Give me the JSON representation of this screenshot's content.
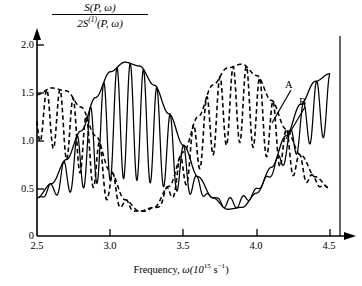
{
  "chart_data": {
    "type": "line",
    "title": "",
    "xlabel": "Frequency, ω(10¹⁵ s⁻¹)",
    "ylabel": "S(P, ω) / 2S⁽¹⁾(P, ω)",
    "ylabel_numerator": "S(P, ω)",
    "ylabel_denominator": "2S(1)(P, ω)",
    "xlim": [
      2.5,
      4.5
    ],
    "ylim": [
      0.0,
      2.0
    ],
    "xticks": [
      "2.5",
      "3.0",
      "3.5",
      "4.0",
      "4.5"
    ],
    "xtick_values": [
      2.5,
      3.0,
      3.5,
      4.0,
      4.5
    ],
    "yticks": [
      "0",
      "0.5",
      "1.0",
      "1.5",
      "2.0"
    ],
    "ytick_values": [
      0.0,
      0.5,
      1.0,
      1.5,
      2.0
    ],
    "grid": false,
    "legend": "none",
    "annotations": [
      {
        "label": "A",
        "x": 4.13,
        "y": 1.42,
        "points_to_x": 4.22,
        "points_to_y": 1.05,
        "style": "solid"
      },
      {
        "label": "B",
        "x": 4.24,
        "y": 1.25,
        "points_to_x": 4.33,
        "points_to_y": 0.88,
        "style": "dashed"
      }
    ],
    "series": [
      {
        "name": "A-envelope-upper",
        "style": "solid",
        "description": "Slow cosine envelope of solid oscillating curve",
        "model": {
          "mean": 1.04,
          "amplitude": 0.78,
          "period": 0.86,
          "phase_x": 3.12
        },
        "x": [
          2.5,
          2.6,
          2.7,
          2.8,
          2.9,
          3.0,
          3.1,
          3.2,
          3.3,
          3.4,
          3.5,
          3.6,
          3.7,
          3.8,
          3.9,
          4.0,
          4.1,
          4.2,
          4.3,
          4.4,
          4.5
        ],
        "y": [
          0.4,
          0.55,
          0.8,
          1.1,
          1.45,
          1.72,
          1.82,
          1.78,
          1.58,
          1.28,
          0.95,
          0.62,
          0.4,
          0.28,
          0.3,
          0.45,
          0.72,
          1.05,
          1.38,
          1.62,
          1.7
        ]
      },
      {
        "name": "A-envelope-lower",
        "style": "solid",
        "description": "Lower mirror of solid envelope",
        "x": [
          2.5,
          2.6,
          2.7,
          2.8,
          2.9,
          3.0,
          3.1,
          3.2,
          3.3,
          3.4,
          3.5,
          3.6,
          3.7,
          3.8,
          3.9,
          4.0,
          4.1,
          4.2,
          4.3,
          4.4,
          4.5
        ],
        "y": [
          0.4,
          0.42,
          0.45,
          0.5,
          0.55,
          0.58,
          0.6,
          0.58,
          0.55,
          0.5,
          0.45,
          0.42,
          0.4,
          0.4,
          0.42,
          0.5,
          0.62,
          0.75,
          0.88,
          1.0,
          1.05
        ]
      },
      {
        "name": "B-envelope-upper",
        "style": "dashed",
        "description": "Slow cosine envelope of dashed oscillating curve, in anti-phase with A",
        "model": {
          "mean": 1.02,
          "amplitude": 0.76,
          "period": 0.86,
          "phase_x": 2.7
        },
        "x": [
          2.5,
          2.6,
          2.7,
          2.8,
          2.9,
          3.0,
          3.1,
          3.2,
          3.3,
          3.4,
          3.5,
          3.6,
          3.7,
          3.8,
          3.9,
          4.0,
          4.1,
          4.2,
          4.3,
          4.4,
          4.5
        ],
        "y": [
          1.48,
          1.55,
          1.52,
          1.35,
          1.05,
          0.68,
          0.38,
          0.26,
          0.3,
          0.52,
          0.88,
          1.25,
          1.58,
          1.76,
          1.8,
          1.68,
          1.42,
          1.12,
          0.85,
          0.62,
          0.5
        ]
      },
      {
        "name": "B-envelope-lower",
        "style": "dashed",
        "description": "Lower mirror of dashed envelope",
        "x": [
          2.5,
          2.6,
          2.7,
          2.8,
          2.9,
          3.0,
          3.1,
          3.2,
          3.3,
          3.4,
          3.5,
          3.6,
          3.7,
          3.8,
          3.9,
          4.0,
          4.1,
          4.2,
          4.3,
          4.4,
          4.5
        ],
        "y": [
          1.0,
          0.92,
          0.8,
          0.66,
          0.5,
          0.36,
          0.28,
          0.25,
          0.28,
          0.38,
          0.52,
          0.7,
          0.85,
          0.95,
          0.98,
          0.92,
          0.8,
          0.68,
          0.58,
          0.52,
          0.5
        ]
      },
      {
        "name": "A-oscillation",
        "style": "solid",
        "description": "Rapid oscillation filling the solid envelope (~22 cycles across range)",
        "cycles": 22,
        "fill_between": [
          "A-envelope-lower",
          "A-envelope-upper"
        ]
      },
      {
        "name": "B-oscillation",
        "style": "dashed",
        "description": "Rapid oscillation filling the dashed envelope (~22 cycles across range)",
        "cycles": 22,
        "fill_between": [
          "B-envelope-lower",
          "B-envelope-upper"
        ]
      }
    ]
  },
  "axes": {
    "x_label": "Frequency, ω(10¹⁵ s⁻¹)",
    "x_label_prefix": "Frequency, ",
    "x_label_var": "ω(10",
    "x_label_exp1": "15",
    "x_label_mid": " s",
    "x_label_exp2": "−1",
    "x_label_suffix": ")",
    "y_num_s": "S",
    "y_num_arg": "(P, ω)",
    "y_den_lead": "2S",
    "y_den_sup": "(1)",
    "y_den_arg": "(P, ω)",
    "xticks": [
      "2.5",
      "3.0",
      "3.5",
      "4.0",
      "4.5"
    ],
    "yticks": [
      "2.0",
      "1.5",
      "1.0",
      "0.5",
      "0"
    ]
  },
  "labels": {
    "curve_a": "A",
    "curve_b": "B"
  },
  "colors": {
    "axis": "#000000",
    "curve": "#000000",
    "background": "#ffffff"
  }
}
